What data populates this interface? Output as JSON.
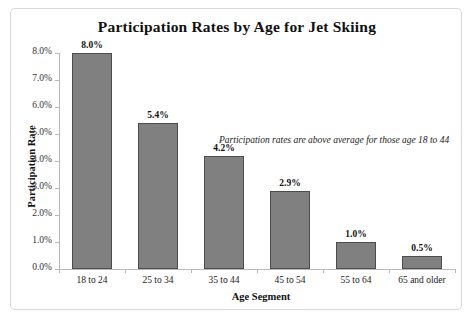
{
  "chart_data": {
    "type": "bar",
    "title": "Participation Rates by Age for Jet Skiing",
    "xlabel": "Age Segment",
    "ylabel": "Participation Rate",
    "categories": [
      "18 to 24",
      "25 to 34",
      "35 to 44",
      "45 to 54",
      "55 to 64",
      "65 and older"
    ],
    "values": [
      8.0,
      5.4,
      4.2,
      2.9,
      1.0,
      0.5
    ],
    "value_labels": [
      "8.0%",
      "5.4%",
      "4.2%",
      "2.9%",
      "1.0%",
      "0.5%"
    ],
    "ylim": [
      0,
      8
    ],
    "ytick_values": [
      0.0,
      1.0,
      2.0,
      3.0,
      4.0,
      5.0,
      6.0,
      7.0,
      8.0
    ],
    "ytick_labels": [
      "0.0%",
      "1.0%",
      "2.0%",
      "3.0%",
      "4.0%",
      "5.0%",
      "6.0%",
      "7.0%",
      "8.0%"
    ],
    "grid": false,
    "legend": false,
    "annotations": [
      {
        "text": "Participation rates are above average for those age 18 to 44",
        "style": "italic"
      }
    ],
    "colors": {
      "bar_fill": "#808080",
      "bar_border": "#4c4c4c",
      "axis_line": "#b9b9b9",
      "frame_border": "#d8d8d8",
      "background": "#ffffff",
      "text": "#111111"
    }
  }
}
